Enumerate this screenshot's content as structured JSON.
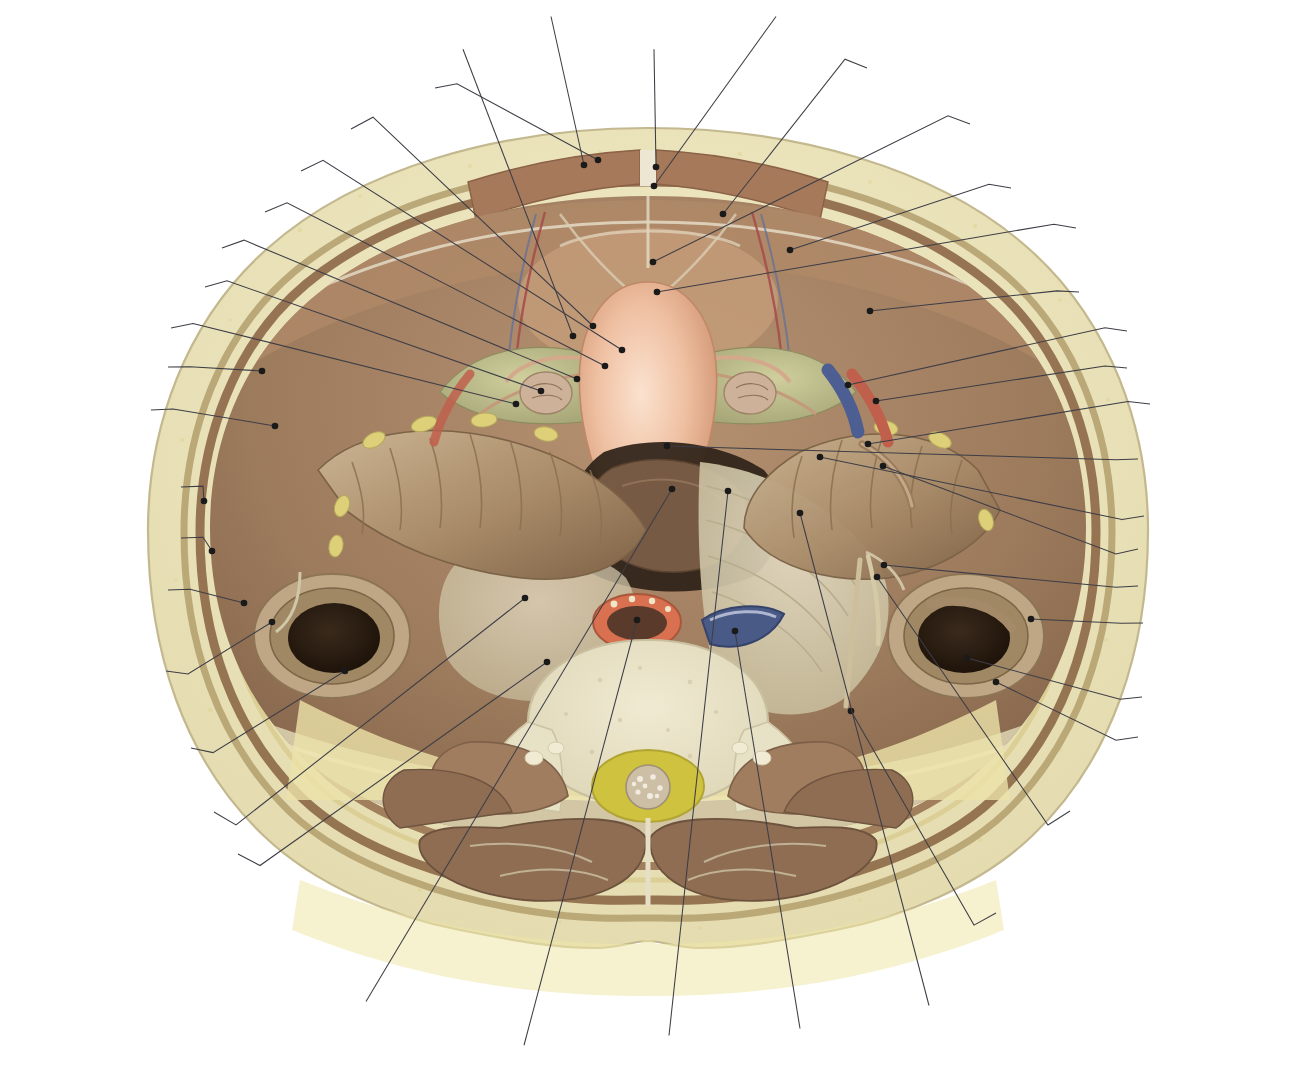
{
  "figure": {
    "language": "pt-BR",
    "view": "transversal / axial",
    "colors": {
      "skin_outline": "#d8cfae",
      "subcutaneous_fat": "#efe6a8",
      "muscle": "#8d6a4d",
      "rectus_abdominis": "#a5795a",
      "peritoneal_serosa": "#cfc8b0",
      "uterus": "#e8b497",
      "broad_ligament": "#b9bb87",
      "colon": "#a98f6c",
      "bone_vertebra": "#e6e0c8",
      "aorta": "#d9704f",
      "vena_cava": "#4a5a86",
      "cauda_equina": "#cfc23f",
      "erector_spinae": "#8e6d53",
      "psoas": "#a07d5f",
      "leader_line": "#3d3d46",
      "text": "#231f20",
      "background": "#ffffff"
    }
  },
  "labels": [
    {
      "id": "fossa-paravesical",
      "text": "Fossa paravesical",
      "align": "r",
      "x": 427,
      "y": 88,
      "tip_x": 598,
      "tip_y": 160
    },
    {
      "id": "lig-redondo-utero",
      "text": "Lig. redondo do útero",
      "align": "r",
      "x": 343,
      "y": 129,
      "tip_x": 593,
      "tip_y": 326
    },
    {
      "id": "lig-utero-ovarico",
      "text": "Lig. útero-ovárico",
      "align": "r",
      "x": 293,
      "y": 171,
      "tip_x": 622,
      "tip_y": 350
    },
    {
      "id": "mesossalpinge",
      "text": "Mesossalpinge",
      "align": "r",
      "x": 257,
      "y": 212,
      "tip_x": 605,
      "tip_y": 366
    },
    {
      "id": "tuba-uterina",
      "text": "Tuba uterina",
      "align": "r",
      "x": 214,
      "y": 248,
      "tip_x": 577,
      "tip_y": 379
    },
    {
      "id": "lig-largo-utero",
      "text": "Lig. largo do útero",
      "align": "r",
      "x": 197,
      "y": 287,
      "tip_x": 541,
      "tip_y": 391
    },
    {
      "id": "ovario",
      "text": "Ovário",
      "align": "r",
      "x": 163,
      "y": 328,
      "tip_x": 516,
      "tip_y": 404
    },
    {
      "id": "fascia-transversal",
      "text": "Fáscia transversal",
      "align": "r",
      "x": 160,
      "y": 367,
      "tip_x": 262,
      "tip_y": 371
    },
    {
      "id": "peritonio-parietal",
      "text": "Peritônio\nparietal",
      "align": "r",
      "x": 143,
      "y": 410,
      "tip_x": 275,
      "tip_y": 426
    },
    {
      "id": "m-obliquo-externo",
      "text": "M. oblíquo externo\ndo abdome",
      "align": "r",
      "x": 173,
      "y": 487,
      "tip_x": 204,
      "tip_y": 501
    },
    {
      "id": "m-obliquo-interno",
      "text": "M. oblíquo interno\ndo abdome",
      "align": "r",
      "x": 173,
      "y": 538,
      "tip_x": 212,
      "tip_y": 551
    },
    {
      "id": "m-transverso",
      "text": "M. transverso\ndo abdome",
      "align": "r",
      "x": 160,
      "y": 590,
      "tip_x": 244,
      "tip_y": 603
    },
    {
      "id": "sulco-paracolico-esq",
      "text": "Sulco paracólico",
      "align": "r",
      "x": 158,
      "y": 671,
      "tip_x": 272,
      "tip_y": 622
    },
    {
      "id": "colo-descendente",
      "text": "Colo\ndescendente",
      "align": "r",
      "x": 183,
      "y": 748,
      "tip_x": 345,
      "tip_y": 671
    },
    {
      "id": "mesocolo-sigmoide",
      "text": "Mesocolo sigmoide",
      "align": "r",
      "x": 206,
      "y": 812,
      "tip_x": 525,
      "tip_y": 598
    },
    {
      "id": "a-iliaca-comum",
      "text": "A. ilíaca comum",
      "align": "r",
      "x": 230,
      "y": 854,
      "tip_x": 547,
      "tip_y": 662
    },
    {
      "id": "utero",
      "text": "Útero",
      "align": "c",
      "x": 463,
      "y": 65,
      "tip_x": 573,
      "tip_y": 336
    },
    {
      "id": "m-reto-abdome",
      "text": "M. reto\ndo abdome",
      "align": "c",
      "x": 551,
      "y": 42,
      "tip_x": 584,
      "tip_y": 165
    },
    {
      "id": "linha-alba",
      "text": "Linha alba",
      "align": "c",
      "x": 654,
      "y": 65,
      "tip_x": 656,
      "tip_y": 167
    },
    {
      "id": "lig-umbilical-mediano",
      "text": "Lig. umbilical\nmediano",
      "align": "c",
      "x": 776,
      "y": 42,
      "tip_x": 654,
      "tip_y": 186
    },
    {
      "id": "lig-umbilical-medial",
      "text": "Lig. umbilical medial",
      "align": "l",
      "x": 875,
      "y": 68,
      "tip_x": 723,
      "tip_y": 214
    },
    {
      "id": "bexiga",
      "text": "Bexiga",
      "align": "l",
      "x": 978,
      "y": 124,
      "tip_x": 653,
      "tip_y": 262
    },
    {
      "id": "a-vv-epigastricas",
      "text": "A. e Vv. epigástricas inferiores",
      "align": "l",
      "x": 1019,
      "y": 188,
      "tip_x": 790,
      "tip_y": 250
    },
    {
      "id": "escavacao-vesicouterina",
      "text": "Escavação\nvesicouterina",
      "align": "l",
      "x": 1084,
      "y": 228,
      "tip_x": 657,
      "tip_y": 292
    },
    {
      "id": "anel-inguinal-profundo",
      "text": "Anel inguinal profundo",
      "align": "l",
      "x": 1087,
      "y": 292,
      "tip_x": 870,
      "tip_y": 311
    },
    {
      "id": "v-iliaca-externa",
      "text": "V. ilíaca externa",
      "align": "l",
      "x": 1135,
      "y": 331,
      "tip_x": 848,
      "tip_y": 385
    },
    {
      "id": "a-iliaca-externa",
      "text": "A. ilíaca externa",
      "align": "l",
      "x": 1135,
      "y": 368,
      "tip_x": 876,
      "tip_y": 401
    },
    {
      "id": "apendice-vermiforme",
      "text": "Apêndice\nvermiforme",
      "align": "l",
      "x": 1158,
      "y": 404,
      "tip_x": 868,
      "tip_y": 444
    },
    {
      "id": "escavacao-retouterina",
      "text": "Escavação\nretouterina",
      "align": "l",
      "x": 1146,
      "y": 459,
      "tip_x": 667,
      "tip_y": 446
    },
    {
      "id": "ceco",
      "text": "Ceco",
      "align": "l",
      "x": 1152,
      "y": 516,
      "tip_x": 820,
      "tip_y": 457
    },
    {
      "id": "mesoapendice",
      "text": "Mesoapêndice",
      "align": "l",
      "x": 1146,
      "y": 549,
      "tip_x": 883,
      "tip_y": 466
    },
    {
      "id": "pregas-cecais",
      "text": "Pregas cecais",
      "align": "l",
      "x": 1146,
      "y": 586,
      "tip_x": 884,
      "tip_y": 565
    },
    {
      "id": "sulco-paracolico-dir",
      "text": "Sulco paracólico",
      "align": "l",
      "x": 1151,
      "y": 623,
      "tip_x": 1031,
      "tip_y": 619
    },
    {
      "id": "ileo",
      "text": "Íleo",
      "align": "l",
      "x": 1150,
      "y": 697,
      "tip_x": 967,
      "tip_y": 658
    },
    {
      "id": "colo-ascendente",
      "text": "Colo ascendente",
      "align": "l",
      "x": 1146,
      "y": 737,
      "tip_x": 996,
      "tip_y": 682
    },
    {
      "id": "ureter-pelvica",
      "text": "Ureter\n(parte pélvica)",
      "align": "l",
      "x": 1078,
      "y": 811,
      "tip_x": 877,
      "tip_y": 577
    },
    {
      "id": "ureter-abdominal",
      "text": "Ureter\n(parte abdominal)",
      "align": "l",
      "x": 1004,
      "y": 913,
      "tip_x": 851,
      "tip_y": 711
    },
    {
      "id": "prega-retouterina",
      "text": "Prega\nretouterina",
      "align": "c",
      "x": 929,
      "y": 980,
      "tip_x": 800,
      "tip_y": 513
    },
    {
      "id": "v-cava-inferior",
      "text": "V. cava\ninferior",
      "align": "c",
      "x": 800,
      "y": 1003,
      "tip_x": 735,
      "tip_y": 631
    },
    {
      "id": "fossa-pararretal",
      "text": "Fossa\npararretal",
      "align": "c",
      "x": 669,
      "y": 1010,
      "tip_x": 728,
      "tip_y": 491
    },
    {
      "id": "parte-abdominal-aorta",
      "text": "Parte\nabdominal\nda aorta",
      "align": "c",
      "x": 524,
      "y": 1010,
      "tip_x": 637,
      "tip_y": 620
    },
    {
      "id": "ampola-do-reto",
      "text": "Ampola\ndo reto",
      "align": "c",
      "x": 366,
      "y": 976,
      "tip_x": 672,
      "tip_y": 489
    }
  ],
  "anatomy_structures": [
    {
      "id": "pele-tecido-subcutaneo",
      "name": "Pele e tecido subcutâneo"
    },
    {
      "id": "m-reto-do-abdome",
      "name": "M. reto do abdome"
    },
    {
      "id": "parede-lateral",
      "name": "Músculos da parede lateral do abdome"
    },
    {
      "id": "cavidade-peritoneal",
      "name": "Cavidade peritoneal"
    },
    {
      "id": "utero-corpo",
      "name": "Útero"
    },
    {
      "id": "lig-largo",
      "name": "Lig. largo do útero"
    },
    {
      "id": "ovario-esq",
      "name": "Ovário esquerdo"
    },
    {
      "id": "ovario-dir",
      "name": "Ovário direito"
    },
    {
      "id": "colo-descendente-lumen",
      "name": "Colo descendente"
    },
    {
      "id": "ceco-lumen",
      "name": "Ceco / colo ascendente"
    },
    {
      "id": "reto-ampola",
      "name": "Ampola do reto"
    },
    {
      "id": "aorta-abdominal",
      "name": "Parte abdominal da aorta"
    },
    {
      "id": "veia-cava-inferior",
      "name": "V. cava inferior"
    },
    {
      "id": "corpo-vertebral",
      "name": "Corpo vertebral"
    },
    {
      "id": "cauda-equina",
      "name": "Cauda equina no canal vertebral"
    },
    {
      "id": "m-eretor-espinha",
      "name": "M. eretor da espinha"
    },
    {
      "id": "m-psoas",
      "name": "M. psoas maior"
    }
  ]
}
